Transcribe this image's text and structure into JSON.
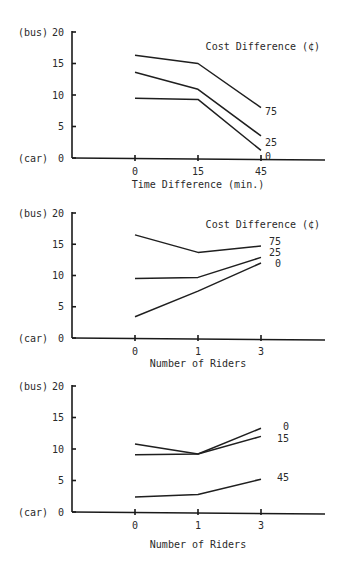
{
  "chart_data": [
    {
      "type": "line",
      "title": "",
      "legend_title": "Cost Difference (¢)",
      "xlabel": "Time Difference (min.)",
      "ylabel": "",
      "y_top_label": "(bus)",
      "y_bottom_label": "(car)",
      "ylim": [
        0,
        20
      ],
      "yticks": [
        0,
        5,
        10,
        15,
        20
      ],
      "categories": [
        "0",
        "15",
        "45"
      ],
      "grid": false,
      "series": [
        {
          "name": "75",
          "values": [
            16.3,
            15.0,
            8.0
          ]
        },
        {
          "name": "25",
          "values": [
            13.6,
            10.9,
            3.5
          ]
        },
        {
          "name": "0",
          "values": [
            9.5,
            9.3,
            1.2
          ]
        }
      ]
    },
    {
      "type": "line",
      "title": "",
      "legend_title": "Cost Difference (¢)",
      "xlabel": "Number of Riders",
      "ylabel": "",
      "y_top_label": "(bus)",
      "y_bottom_label": "(car)",
      "ylim": [
        0,
        20
      ],
      "yticks": [
        0,
        5,
        10,
        15,
        20
      ],
      "categories": [
        "0",
        "1",
        "3"
      ],
      "grid": false,
      "series": [
        {
          "name": "75",
          "values": [
            16.5,
            13.7,
            14.7
          ]
        },
        {
          "name": "25",
          "values": [
            9.5,
            9.7,
            12.9
          ]
        },
        {
          "name": "0",
          "values": [
            3.4,
            7.5,
            12.0
          ]
        }
      ]
    },
    {
      "type": "line",
      "title": "",
      "legend_title": "",
      "xlabel": "Number of Riders",
      "ylabel": "",
      "y_top_label": "(bus)",
      "y_bottom_label": "(car)",
      "ylim": [
        0,
        20
      ],
      "yticks": [
        0,
        5,
        10,
        15,
        20
      ],
      "categories": [
        "0",
        "1",
        "3"
      ],
      "grid": false,
      "series": [
        {
          "name": "0",
          "values": [
            10.8,
            9.2,
            13.3
          ]
        },
        {
          "name": "15",
          "values": [
            9.1,
            9.2,
            12.0
          ]
        },
        {
          "name": "45",
          "values": [
            2.4,
            2.8,
            5.2
          ]
        }
      ]
    }
  ],
  "layout": {
    "panels": [
      {
        "top": 0,
        "height": 195,
        "y20": 32,
        "y0": 158,
        "xlabel_y": 188,
        "legend_y": 50,
        "label_offsets": [
          [
            0,
            3
          ],
          [
            0,
            6
          ],
          [
            0,
            6
          ]
        ]
      },
      {
        "top": 195,
        "height": 185,
        "y20": 18,
        "y0": 143,
        "xlabel_y": 172,
        "legend_y": 33,
        "label_offsets": [
          [
            4,
            -5
          ],
          [
            4,
            -5
          ],
          [
            10,
            0
          ]
        ]
      },
      {
        "top": 380,
        "height": 190,
        "y20": 6,
        "y0": 132,
        "xlabel_y": 168,
        "legend_y": 0,
        "label_offsets": [
          [
            18,
            -2
          ],
          [
            12,
            2
          ],
          [
            12,
            -2
          ]
        ]
      }
    ],
    "axis_x": 72,
    "axis_right": 325,
    "x_positions": [
      135,
      198,
      261
    ]
  }
}
